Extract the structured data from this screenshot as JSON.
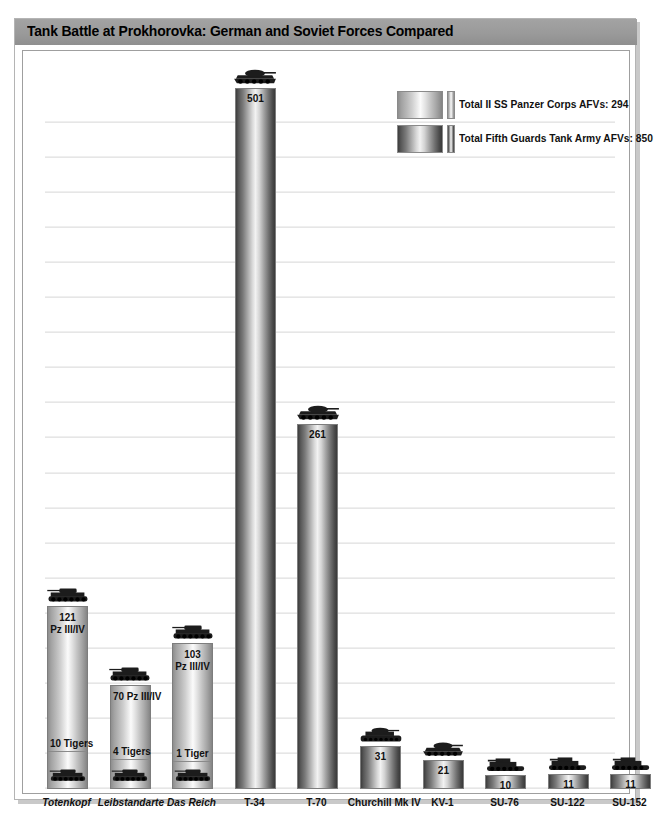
{
  "header": {
    "title": "Tank Battle at Prokhorovka: German and Soviet Forces Compared"
  },
  "legend": {
    "items": [
      {
        "label": "Total II SS Panzer Corps AFVs: 294",
        "swatch": "german-gradient-swatch",
        "color_dark": "#848484",
        "color_light": "#fbfbfb"
      },
      {
        "label": "Total Fifth Guards Tank Army AFVs: 850",
        "swatch": "soviet-gradient-swatch",
        "color_dark": "#3a3a3a",
        "color_light": "#f2f2f2"
      }
    ]
  },
  "chart_data": {
    "type": "bar",
    "title": "Tank Battle at Prokhorovka: German and Soviet Forces Compared",
    "xlabel": "",
    "ylabel": "",
    "ylim": [
      0,
      530
    ],
    "grid": true,
    "legend_position": "top-right",
    "categories": [
      "Totenkopf",
      "Leibstandarte",
      "Das Reich",
      "T-34",
      "T-70",
      "Churchill Mk IV",
      "KV-1",
      "SU-76",
      "SU-122",
      "SU-152"
    ],
    "values": [
      131,
      74,
      104,
      501,
      261,
      31,
      21,
      10,
      11,
      11
    ],
    "bars": [
      {
        "category": "Totenkopf",
        "side": "german",
        "italic_label": true,
        "total": 131,
        "icon": "panzer-iii-iv-tank-icon",
        "segments": [
          {
            "label": "121 Pz III/IV",
            "label_lines": [
              "121",
              "Pz III/IV"
            ],
            "value": 121,
            "icon": ""
          },
          {
            "label": "10 Tigers",
            "label_lines": [
              "10 Tigers"
            ],
            "value": 10,
            "icon": "tiger-tank-icon"
          }
        ]
      },
      {
        "category": "Leibstandarte",
        "side": "german",
        "italic_label": true,
        "total": 74,
        "icon": "panzer-iii-iv-tank-icon",
        "segments": [
          {
            "label": "70 Pz III/IV",
            "label_lines": [
              "70 Pz III/IV"
            ],
            "value": 70,
            "icon": ""
          },
          {
            "label": "4 Tigers",
            "label_lines": [
              "4 Tigers"
            ],
            "value": 4,
            "icon": "tiger-tank-icon"
          }
        ]
      },
      {
        "category": "Das Reich",
        "side": "german",
        "italic_label": true,
        "total": 104,
        "icon": "panzer-iii-iv-tank-icon",
        "segments": [
          {
            "label": "103 Pz III/IV",
            "label_lines": [
              "103",
              "Pz III/IV"
            ],
            "value": 103,
            "icon": ""
          },
          {
            "label": "1 Tiger",
            "label_lines": [
              "1 Tiger"
            ],
            "value": 1,
            "icon": "tiger-tank-icon"
          }
        ]
      },
      {
        "category": "T-34",
        "side": "soviet",
        "italic_label": false,
        "total": 501,
        "value_label": "501",
        "icon": "t34-tank-icon",
        "segments": []
      },
      {
        "category": "T-70",
        "side": "soviet",
        "italic_label": false,
        "total": 261,
        "value_label": "261",
        "icon": "t70-tank-icon",
        "segments": []
      },
      {
        "category": "Churchill Mk IV",
        "side": "soviet",
        "italic_label": false,
        "total": 31,
        "value_label": "31",
        "icon": "churchill-tank-icon",
        "segments": []
      },
      {
        "category": "KV-1",
        "side": "soviet",
        "italic_label": false,
        "total": 21,
        "value_label": "21",
        "icon": "kv1-tank-icon",
        "segments": []
      },
      {
        "category": "SU-76",
        "side": "soviet",
        "italic_label": false,
        "total": 10,
        "value_label": "10",
        "icon": "su76-assault-gun-icon",
        "segments": []
      },
      {
        "category": "SU-122",
        "side": "soviet",
        "italic_label": false,
        "total": 11,
        "value_label": "11",
        "icon": "su122-assault-gun-icon",
        "segments": []
      },
      {
        "category": "SU-152",
        "side": "soviet",
        "italic_label": false,
        "total": 11,
        "value_label": "11",
        "icon": "su152-assault-gun-icon",
        "segments": []
      }
    ],
    "totals": {
      "german_afv_total": 294,
      "soviet_afv_total": 850
    }
  }
}
